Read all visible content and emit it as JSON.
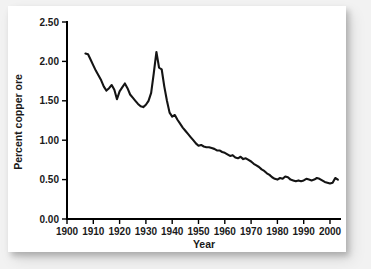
{
  "figure": {
    "background_color": "#f2f2f2",
    "card_color": "#ffffff",
    "line_color": "#141414"
  },
  "chart_data": {
    "type": "line",
    "title": "",
    "subtitle": "",
    "xlabel": "Year",
    "ylabel": "Percent copper ore",
    "xlim": [
      1900,
      2005
    ],
    "ylim": [
      0.0,
      2.5
    ],
    "grid": false,
    "legend": false,
    "legend_position": "none",
    "xticks": [
      1900,
      1910,
      1920,
      1930,
      1940,
      1950,
      1960,
      1970,
      1980,
      1990,
      2000
    ],
    "xtick_labels": [
      "1900",
      "1910",
      "1920",
      "1930",
      "1940",
      "1950",
      "1960",
      "1970",
      "1980",
      "1990",
      "2000"
    ],
    "yticks": [
      0.0,
      0.5,
      1.0,
      1.5,
      2.0,
      2.5
    ],
    "ytick_labels": [
      "0.00",
      "0.50",
      "1.00",
      "1.50",
      "2.00",
      "2.50"
    ],
    "series": [
      {
        "name": "Percent copper ore",
        "x": [
          1907,
          1908,
          1909,
          1910,
          1911,
          1912,
          1913,
          1914,
          1915,
          1916,
          1917,
          1918,
          1919,
          1920,
          1921,
          1922,
          1923,
          1924,
          1925,
          1926,
          1927,
          1928,
          1929,
          1930,
          1931,
          1932,
          1933,
          1934,
          1935,
          1936,
          1937,
          1938,
          1939,
          1940,
          1941,
          1942,
          1943,
          1944,
          1945,
          1946,
          1947,
          1948,
          1949,
          1950,
          1951,
          1952,
          1953,
          1954,
          1955,
          1956,
          1957,
          1958,
          1959,
          1960,
          1961,
          1962,
          1963,
          1964,
          1965,
          1966,
          1967,
          1968,
          1969,
          1970,
          1971,
          1972,
          1973,
          1974,
          1975,
          1976,
          1977,
          1978,
          1979,
          1980,
          1981,
          1982,
          1983,
          1984,
          1985,
          1986,
          1987,
          1988,
          1989,
          1990,
          1991,
          1992,
          1993,
          1994,
          1995,
          1996,
          1997,
          1998,
          1999,
          2000,
          2001,
          2002,
          2003
        ],
        "values": [
          2.1,
          2.09,
          2.02,
          1.95,
          1.88,
          1.82,
          1.76,
          1.68,
          1.63,
          1.66,
          1.7,
          1.64,
          1.52,
          1.62,
          1.67,
          1.72,
          1.66,
          1.58,
          1.54,
          1.5,
          1.46,
          1.43,
          1.42,
          1.45,
          1.5,
          1.6,
          1.85,
          2.12,
          1.92,
          1.9,
          1.68,
          1.5,
          1.35,
          1.3,
          1.32,
          1.26,
          1.21,
          1.16,
          1.12,
          1.08,
          1.04,
          1.0,
          0.96,
          0.93,
          0.94,
          0.92,
          0.91,
          0.91,
          0.9,
          0.89,
          0.87,
          0.87,
          0.85,
          0.84,
          0.82,
          0.8,
          0.81,
          0.78,
          0.77,
          0.79,
          0.76,
          0.77,
          0.75,
          0.73,
          0.7,
          0.68,
          0.66,
          0.63,
          0.61,
          0.58,
          0.56,
          0.53,
          0.51,
          0.5,
          0.52,
          0.51,
          0.54,
          0.53,
          0.5,
          0.49,
          0.48,
          0.49,
          0.48,
          0.49,
          0.51,
          0.5,
          0.49,
          0.5,
          0.52,
          0.51,
          0.49,
          0.47,
          0.46,
          0.45,
          0.46,
          0.52,
          0.5
        ]
      }
    ],
    "annotations": []
  }
}
